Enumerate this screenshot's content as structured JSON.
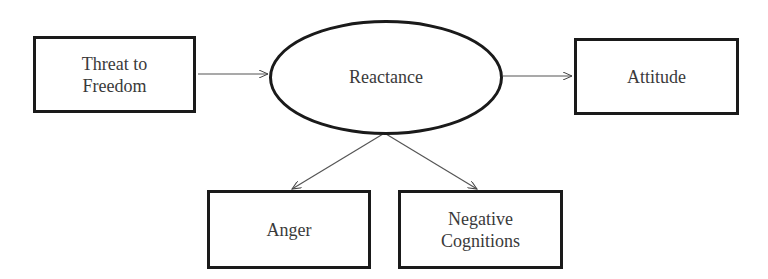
{
  "diagram": {
    "nodes": {
      "threat": {
        "label": "Threat to\nFreedom",
        "shape": "rectangle"
      },
      "reactance": {
        "label": "Reactance",
        "shape": "ellipse"
      },
      "attitude": {
        "label": "Attitude",
        "shape": "rectangle"
      },
      "anger": {
        "label": "Anger",
        "shape": "rectangle"
      },
      "negative": {
        "label": "Negative\nCognitions",
        "shape": "rectangle"
      }
    },
    "edges": [
      {
        "from": "Threat to Freedom",
        "to": "Reactance"
      },
      {
        "from": "Reactance",
        "to": "Attitude"
      },
      {
        "from": "Reactance",
        "to": "Anger"
      },
      {
        "from": "Reactance",
        "to": "Negative Cognitions"
      }
    ],
    "colors": {
      "stroke": "#1a1a1a",
      "text": "#3a3a3a",
      "background": "#ffffff"
    }
  }
}
